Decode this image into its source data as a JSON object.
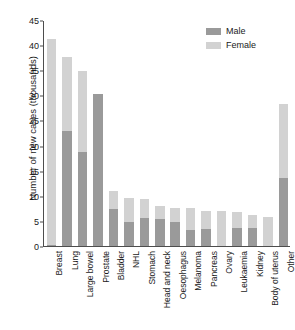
{
  "chart_data": {
    "type": "bar",
    "subtype": "stacked-bar",
    "title": "",
    "xlabel": "",
    "ylabel": "Number of new cases (thousands)",
    "ylim": [
      0,
      45
    ],
    "ytick_step": 5,
    "yticks": [
      "45",
      "40",
      "35",
      "30",
      "25",
      "20",
      "15",
      "10",
      "5",
      "0"
    ],
    "grid": false,
    "legend_position": "top-right",
    "categories": [
      "Breast",
      "Lung",
      "Large bowel",
      "Prostate",
      "Bladder",
      "NHL",
      "Stomach",
      "Head and neck",
      "Oesophagus",
      "Melanoma",
      "Pancreas",
      "Ovary",
      "Leukaemia",
      "Kidney",
      "Body of uterus",
      "Other"
    ],
    "series": [
      {
        "name": "Male",
        "color": "#9a9a9a",
        "values": [
          0.3,
          23.0,
          18.7,
          30.3,
          7.4,
          4.7,
          5.6,
          5.3,
          4.7,
          3.2,
          3.4,
          0.0,
          3.6,
          3.6,
          0.0,
          13.5
        ]
      },
      {
        "name": "Female",
        "color": "#d2d2d2",
        "values": [
          40.9,
          14.6,
          16.1,
          0.0,
          3.5,
          4.8,
          3.8,
          2.6,
          2.9,
          4.3,
          3.6,
          7.0,
          3.2,
          2.6,
          5.7,
          14.7
        ]
      }
    ],
    "totals": [
      41.2,
      37.6,
      34.8,
      30.3,
      10.9,
      9.5,
      9.4,
      7.9,
      7.6,
      7.5,
      7.0,
      7.0,
      6.8,
      6.2,
      5.7,
      28.2
    ]
  },
  "legend": {
    "items": [
      {
        "label": "Male",
        "color": "#9a9a9a"
      },
      {
        "label": "Female",
        "color": "#d2d2d2"
      }
    ]
  },
  "colors": {
    "male": "#9a9a9a",
    "female": "#d2d2d2",
    "axis": "#4d4d4d",
    "text": "#1a1a1a",
    "background": "#ffffff"
  }
}
